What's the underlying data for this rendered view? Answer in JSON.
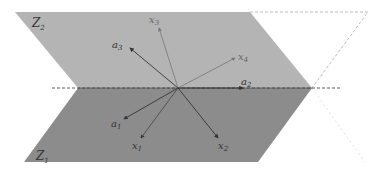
{
  "diagram": {
    "planes": [
      {
        "id": "upper",
        "label": "Z",
        "sub": "2",
        "color": "#b4b4b4"
      },
      {
        "id": "lower",
        "label": "Z",
        "sub": "1",
        "color": "#8c8c8c"
      }
    ],
    "vectors": [
      {
        "name": "a3",
        "label": "a",
        "sub": "3"
      },
      {
        "name": "x3",
        "label": "x",
        "sub": "3"
      },
      {
        "name": "x4",
        "label": "x",
        "sub": "4"
      },
      {
        "name": "a2",
        "label": "a",
        "sub": "2"
      },
      {
        "name": "a1",
        "label": "a",
        "sub": "1"
      },
      {
        "name": "x1",
        "label": "x",
        "sub": "1"
      },
      {
        "name": "x2",
        "label": "x",
        "sub": "2"
      }
    ],
    "colors": {
      "line": "#444444",
      "faint_line": "#777777",
      "dashed": "#999999",
      "boundary": "#333333"
    }
  }
}
